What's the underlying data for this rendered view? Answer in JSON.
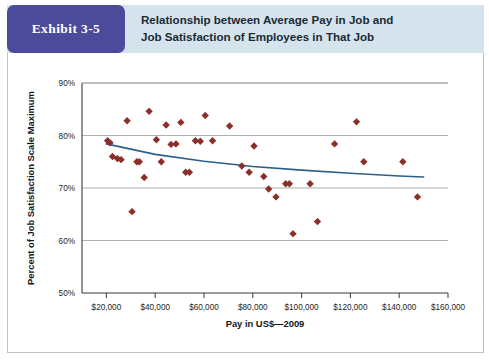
{
  "exhibit": {
    "badge_label": "Exhibit 3-5",
    "title_line1": "Relationship between Average Pay in Job and",
    "title_line2": "Job Satisfaction of Employees in That Job",
    "badge_color": "#4b4a9b",
    "header_background": "#d5e4ec"
  },
  "chart_data": {
    "type": "scatter",
    "title": "Relationship between Average Pay in Job and Job Satisfaction of Employees in That Job",
    "xlabel": "Pay in US$—2009",
    "ylabel": "Percent of Job Satisfaction Scale Maximum",
    "xlim": [
      10000,
      160000
    ],
    "ylim": [
      50,
      90
    ],
    "xticks": [
      20000,
      40000,
      60000,
      80000,
      100000,
      120000,
      140000,
      160000
    ],
    "xtick_labels": [
      "$20,000",
      "$40,000",
      "$60,000",
      "$80,000",
      "$100,000",
      "$120,000",
      "$140,000",
      "$160,000"
    ],
    "yticks": [
      50,
      60,
      70,
      80,
      90
    ],
    "ytick_labels": [
      "50%",
      "60%",
      "70%",
      "80%",
      "90%"
    ],
    "grid": "horizontal",
    "legend": "none",
    "marker": "diamond",
    "marker_color": "#8c2f2a",
    "trendline_color": "#2c5f8a",
    "points": [
      {
        "x": 20500,
        "y": 79.0
      },
      {
        "x": 21500,
        "y": 78.6
      },
      {
        "x": 22500,
        "y": 76.0
      },
      {
        "x": 24500,
        "y": 75.6
      },
      {
        "x": 26000,
        "y": 75.4
      },
      {
        "x": 28500,
        "y": 82.8
      },
      {
        "x": 30500,
        "y": 65.5
      },
      {
        "x": 32500,
        "y": 75.0
      },
      {
        "x": 33500,
        "y": 75.0
      },
      {
        "x": 35500,
        "y": 72.0
      },
      {
        "x": 37500,
        "y": 84.6
      },
      {
        "x": 40500,
        "y": 79.2
      },
      {
        "x": 42500,
        "y": 75.0
      },
      {
        "x": 44500,
        "y": 82.0
      },
      {
        "x": 46500,
        "y": 78.3
      },
      {
        "x": 48500,
        "y": 78.4
      },
      {
        "x": 50500,
        "y": 82.5
      },
      {
        "x": 52500,
        "y": 73.0
      },
      {
        "x": 54000,
        "y": 73.0
      },
      {
        "x": 56500,
        "y": 79.0
      },
      {
        "x": 58500,
        "y": 78.9
      },
      {
        "x": 60500,
        "y": 83.8
      },
      {
        "x": 63500,
        "y": 79.0
      },
      {
        "x": 70500,
        "y": 81.8
      },
      {
        "x": 75500,
        "y": 74.2
      },
      {
        "x": 78500,
        "y": 73.0
      },
      {
        "x": 80500,
        "y": 78.0
      },
      {
        "x": 84500,
        "y": 72.2
      },
      {
        "x": 86500,
        "y": 69.8
      },
      {
        "x": 89500,
        "y": 68.3
      },
      {
        "x": 93500,
        "y": 70.8
      },
      {
        "x": 95000,
        "y": 70.8
      },
      {
        "x": 96500,
        "y": 61.3
      },
      {
        "x": 103500,
        "y": 70.8
      },
      {
        "x": 106500,
        "y": 63.6
      },
      {
        "x": 113500,
        "y": 78.4
      },
      {
        "x": 122500,
        "y": 82.6
      },
      {
        "x": 125500,
        "y": 75.0
      },
      {
        "x": 141500,
        "y": 75.0
      },
      {
        "x": 147500,
        "y": 68.3
      }
    ],
    "trendline": [
      {
        "x": 20000,
        "y": 78.4
      },
      {
        "x": 40000,
        "y": 76.4
      },
      {
        "x": 60000,
        "y": 75.1
      },
      {
        "x": 80000,
        "y": 74.1
      },
      {
        "x": 100000,
        "y": 73.4
      },
      {
        "x": 120000,
        "y": 72.8
      },
      {
        "x": 140000,
        "y": 72.3
      },
      {
        "x": 150000,
        "y": 72.1
      }
    ]
  }
}
